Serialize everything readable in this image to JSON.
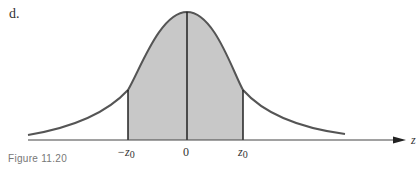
{
  "part_label": "d.",
  "caption": "Figure 11.20",
  "axis": {
    "variable": "z"
  },
  "ticks": [
    {
      "id": "neg_z0",
      "main": "−z",
      "sub": "0"
    },
    {
      "id": "zero",
      "main": "0"
    },
    {
      "id": "pos_z0",
      "main": "z",
      "sub": "0"
    }
  ],
  "colors": {
    "curve": "#555555",
    "shade": "#c8c8c8",
    "axis": "#444444",
    "lines": "#222222"
  },
  "figure": {
    "type": "normal-curve",
    "shaded_region": "between -z0 and z0",
    "vertical_lines_at": [
      "-z0",
      "0",
      "z0"
    ]
  }
}
